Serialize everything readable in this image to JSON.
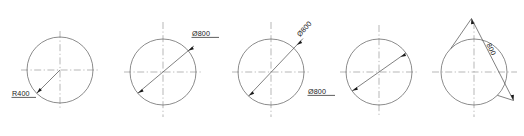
{
  "drawing": {
    "title": "Circle dimensioning styles",
    "background_color": "#ffffff",
    "object_line_color": "#5a5a5a",
    "center_line_color": "#9a9a9a",
    "text_color": "#1a1a1a",
    "figures": [
      {
        "id": "figure-1",
        "dimension_type": "radius",
        "label": "R400",
        "label_underlined": true,
        "label_rotation_deg": 0,
        "center": {
          "x": 60,
          "y": 70
        },
        "radius": 33,
        "leader_angle_deg": 225,
        "arrow_count": 1,
        "text_position": "outside-lower-left"
      },
      {
        "id": "figure-2",
        "dimension_type": "diameter",
        "label": "Ø800",
        "label_underlined": true,
        "label_rotation_deg": 0,
        "center": {
          "x": 163,
          "y": 72
        },
        "radius": 33,
        "leader_angle_deg": 40,
        "arrow_count": 2,
        "text_position": "outside-upper-right"
      },
      {
        "id": "figure-3",
        "dimension_type": "diameter",
        "label": "Ø800",
        "label_underlined": false,
        "label_rotation_deg": -47,
        "center": {
          "x": 271,
          "y": 72
        },
        "radius": 33,
        "leader_angle_deg": 47,
        "arrow_count": 2,
        "text_position": "aligned-upper-right"
      },
      {
        "id": "figure-4",
        "dimension_type": "diameter",
        "label": "Ø800",
        "label_underlined": true,
        "label_rotation_deg": 0,
        "center": {
          "x": 379,
          "y": 72
        },
        "radius": 33,
        "leader_angle_deg": 35,
        "arrow_count": 2,
        "text_position": "outside-lower-left"
      },
      {
        "id": "figure-5",
        "dimension_type": "diameter-offset",
        "label": "800",
        "label_underlined": false,
        "label_rotation_deg": -45,
        "center": {
          "x": 474,
          "y": 72
        },
        "radius": 33,
        "leader_angle_deg": 45,
        "arrow_count": 2,
        "offset_distance": 14,
        "text_position": "aligned-offset-upper-right"
      }
    ]
  }
}
